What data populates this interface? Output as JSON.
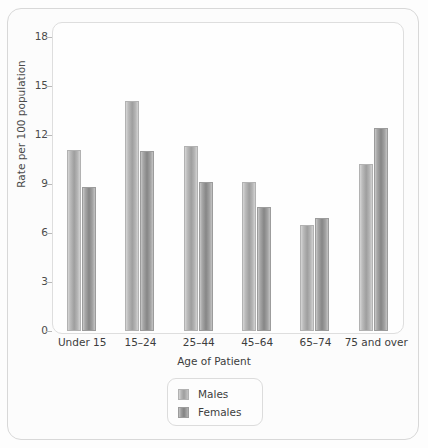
{
  "chart_data": {
    "type": "bar",
    "title": "",
    "subtitle": "",
    "xlabel": "Age of Patient",
    "ylabel": "Rate per 100 population",
    "categories": [
      "Under 15",
      "15–24",
      "25–44",
      "45–64",
      "65–74",
      "75 and over"
    ],
    "series": [
      {
        "name": "Males",
        "values": [
          11.1,
          14.1,
          11.3,
          9.1,
          6.5,
          10.2
        ],
        "color": "#9e9e9e"
      },
      {
        "name": "Females",
        "values": [
          8.8,
          11.0,
          9.1,
          7.6,
          6.9,
          12.4
        ],
        "color": "#868686"
      }
    ],
    "ylim": [
      0,
      18
    ],
    "yticks": [
      0,
      3,
      6,
      9,
      12,
      15,
      18
    ],
    "ytick_labels": [
      "0",
      "3",
      "6",
      "9",
      "12",
      "15",
      "18"
    ],
    "grid": false,
    "legend_position": "bottom-center",
    "legend_entries": [
      "Males",
      "Females"
    ]
  },
  "legend": {
    "items": [
      {
        "label": "Males"
      },
      {
        "label": "Females"
      }
    ]
  }
}
